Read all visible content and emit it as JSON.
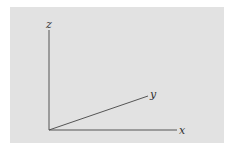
{
  "diagram": {
    "title": "",
    "background_color": "#e2e2e2",
    "line_color": "#555555",
    "origin": [
      49,
      130
    ],
    "axes": [
      {
        "name": "x",
        "label": "x",
        "end": [
          177,
          130
        ],
        "label_pos": [
          179,
          134
        ]
      },
      {
        "name": "y",
        "label": "y",
        "end": [
          148,
          96
        ],
        "label_pos": [
          150,
          98
        ]
      },
      {
        "name": "z",
        "label": "z",
        "end": [
          49,
          30
        ],
        "label_pos": [
          46,
          28
        ]
      }
    ]
  }
}
